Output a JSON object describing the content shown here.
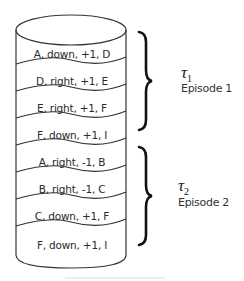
{
  "diagram": {
    "type": "replay-buffer-cylinder",
    "entries": [
      {
        "label": "A, down, +1, D",
        "episode": 1
      },
      {
        "label": "D, right, +1, E",
        "episode": 1
      },
      {
        "label": "E, right, +1, F",
        "episode": 1
      },
      {
        "label": "F, down, +1, I",
        "episode": 1
      },
      {
        "label": "A, right, -1, B",
        "episode": 2
      },
      {
        "label": "B, right, -1, C",
        "episode": 2
      },
      {
        "label": "C, down, +1, F",
        "episode": 2
      },
      {
        "label": "F, down, +1, I",
        "episode": 2
      }
    ],
    "groups": [
      {
        "symbol": "τ",
        "subscript": "1",
        "label": "Episode 1"
      },
      {
        "symbol": "τ",
        "subscript": "2",
        "label": "Episode 2"
      }
    ]
  }
}
